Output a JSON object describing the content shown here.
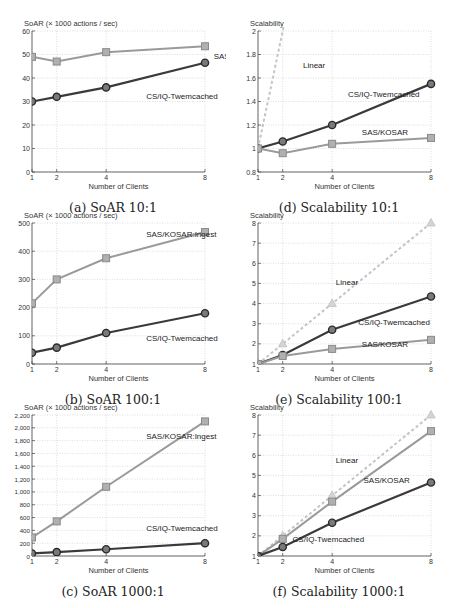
{
  "chart_data": [
    {
      "id": "a",
      "type": "line",
      "caption": "(a) SoAR 10:1",
      "ylabel": "SoAR (× 1000 actions / sec)",
      "xlabel": "Number of Clients",
      "x": [
        1,
        2,
        4,
        8
      ],
      "xticks": [
        "1",
        "2",
        "4",
        "8"
      ],
      "ylim": [
        0,
        60
      ],
      "yticks": [
        0,
        10,
        20,
        30,
        40,
        50,
        60
      ],
      "ytick_labels": [
        "0",
        "10",
        "20",
        "30",
        "40",
        "50",
        "60"
      ],
      "grid": true,
      "series": [
        {
          "name": "SAS/KOSAR:Ingest",
          "values": [
            49,
            47,
            51,
            53.5
          ],
          "color": "#9a9a9a",
          "marker": "square",
          "dash": false,
          "label_pos": [
            1.05,
            0.8
          ]
        },
        {
          "name": "CS/IQ-Twemcached",
          "values": [
            30,
            32,
            36,
            46.5
          ],
          "color": "#3a3a3a",
          "marker": "circle",
          "dash": false,
          "label_pos": [
            0.66,
            0.52
          ]
        }
      ]
    },
    {
      "id": "b",
      "type": "line",
      "caption": "(b) SoAR 100:1",
      "ylabel": "SoAR (× 1000 actions / sec)",
      "xlabel": "Number of Clients",
      "x": [
        1,
        2,
        4,
        8
      ],
      "xticks": [
        "1",
        "2",
        "4",
        "8"
      ],
      "ylim": [
        0,
        500
      ],
      "yticks": [
        0,
        100,
        200,
        300,
        400,
        500
      ],
      "ytick_labels": [
        "0",
        "100",
        "200",
        "300",
        "400",
        "500"
      ],
      "grid": true,
      "series": [
        {
          "name": "SAS/KOSAR:Ingest",
          "values": [
            215,
            300,
            375,
            468
          ],
          "color": "#9a9a9a",
          "marker": "square",
          "dash": false,
          "label_pos": [
            0.66,
            0.9
          ]
        },
        {
          "name": "CS/IQ-Twemcached",
          "values": [
            40,
            58,
            110,
            180
          ],
          "color": "#3a3a3a",
          "marker": "circle",
          "dash": false,
          "label_pos": [
            0.66,
            0.16
          ]
        }
      ]
    },
    {
      "id": "c",
      "type": "line",
      "caption": "(c) SoAR 1000:1",
      "ylabel": "SoAR (× 1000 actions / sec)",
      "xlabel": "Number of Clients",
      "x": [
        1,
        2,
        4,
        8
      ],
      "xticks": [
        "1",
        "2",
        "4",
        "8"
      ],
      "ylim": [
        0,
        2200
      ],
      "yticks": [
        0,
        200,
        400,
        600,
        800,
        1000,
        1200,
        1400,
        1600,
        1800,
        2000,
        2200
      ],
      "ytick_labels": [
        "0",
        "200",
        "400",
        "600",
        "800",
        "1,000",
        "1,200",
        "1,400",
        "1,600",
        "1,800",
        "2,000",
        "2,200"
      ],
      "grid": true,
      "series": [
        {
          "name": "SAS/KOSAR:Ingest",
          "values": [
            290,
            540,
            1080,
            2100
          ],
          "color": "#9a9a9a",
          "marker": "square",
          "dash": false,
          "label_pos": [
            0.66,
            0.83
          ]
        },
        {
          "name": "CS/IQ-Twemcached",
          "values": [
            40,
            60,
            105,
            200
          ],
          "color": "#3a3a3a",
          "marker": "circle",
          "dash": false,
          "label_pos": [
            0.66,
            0.18
          ]
        }
      ]
    },
    {
      "id": "d",
      "type": "line",
      "caption": "(d) Scalability 10:1",
      "ylabel": "Scalability",
      "xlabel": "Number of Clients",
      "x": [
        1,
        2,
        4,
        8
      ],
      "xticks": [
        "1",
        "2",
        "4",
        "8"
      ],
      "ylim": [
        0.8,
        2
      ],
      "yticks": [
        0.8,
        1,
        1.2,
        1.4,
        1.6,
        1.8,
        2
      ],
      "ytick_labels": [
        "0.8",
        "1",
        "1.2",
        "1.4",
        "1.6",
        "1.8",
        "2"
      ],
      "grid": true,
      "series": [
        {
          "name": "Linear",
          "values": [
            1,
            2,
            4,
            8
          ],
          "color": "#c4c4c4",
          "marker": "none",
          "dash": true,
          "label_pos": [
            0.26,
            0.74
          ]
        },
        {
          "name": "CS/IQ-Twemcached",
          "values": [
            1,
            1.06,
            1.2,
            1.55
          ],
          "color": "#3a3a3a",
          "marker": "circle",
          "dash": false,
          "label_pos": [
            0.52,
            0.53
          ]
        },
        {
          "name": "SAS/KOSAR",
          "values": [
            1,
            0.96,
            1.04,
            1.09
          ],
          "color": "#9a9a9a",
          "marker": "square",
          "dash": false,
          "label_pos": [
            0.6,
            0.26
          ]
        }
      ]
    },
    {
      "id": "e",
      "type": "line",
      "caption": "(e) Scalability 100:1",
      "ylabel": "Scalability",
      "xlabel": "Number of Clients",
      "x": [
        1,
        2,
        4,
        8
      ],
      "xticks": [
        "1",
        "2",
        "4",
        "8"
      ],
      "ylim": [
        1,
        8
      ],
      "yticks": [
        1,
        2,
        3,
        4,
        5,
        6,
        7,
        8
      ],
      "ytick_labels": [
        "1",
        "2",
        "3",
        "4",
        "5",
        "6",
        "7",
        "8"
      ],
      "grid": true,
      "series": [
        {
          "name": "Linear",
          "values": [
            1,
            2,
            4,
            8
          ],
          "color": "#c4c4c4",
          "marker": "triangle",
          "dash": true,
          "label_pos": [
            0.45,
            0.56
          ]
        },
        {
          "name": "CS/IQ-Twemcached",
          "values": [
            1,
            1.45,
            2.7,
            4.35
          ],
          "color": "#3a3a3a",
          "marker": "circle",
          "dash": false,
          "label_pos": [
            0.58,
            0.28
          ]
        },
        {
          "name": "SAS/KOSAR",
          "values": [
            1,
            1.4,
            1.75,
            2.2
          ],
          "color": "#9a9a9a",
          "marker": "square",
          "dash": false,
          "label_pos": [
            0.6,
            0.12
          ]
        }
      ]
    },
    {
      "id": "f",
      "type": "line",
      "caption": "(f) Scalability 1000:1",
      "ylabel": "Scalability",
      "xlabel": "Number of Clients",
      "x": [
        1,
        2,
        4,
        8
      ],
      "xticks": [
        "1",
        "2",
        "4",
        "8"
      ],
      "ylim": [
        1,
        8
      ],
      "yticks": [
        1,
        2,
        3,
        4,
        5,
        6,
        7,
        8
      ],
      "ytick_labels": [
        "1",
        "2",
        "3",
        "4",
        "5",
        "6",
        "7",
        "8"
      ],
      "grid": true,
      "series": [
        {
          "name": "Linear",
          "values": [
            1,
            2,
            4,
            8
          ],
          "color": "#c4c4c4",
          "marker": "triangle",
          "dash": true,
          "label_pos": [
            0.45,
            0.66
          ]
        },
        {
          "name": "SAS/KOSAR",
          "values": [
            1,
            1.85,
            3.7,
            7.2
          ],
          "color": "#9a9a9a",
          "marker": "square",
          "dash": false,
          "label_pos": [
            0.61,
            0.52
          ]
        },
        {
          "name": "CS/IQ-Twemcached",
          "values": [
            1,
            1.45,
            2.65,
            4.65
          ],
          "color": "#3a3a3a",
          "marker": "circle",
          "dash": false,
          "label_pos": [
            0.2,
            0.1
          ]
        }
      ]
    }
  ]
}
